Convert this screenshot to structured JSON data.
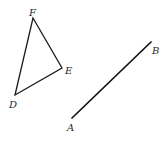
{
  "figure": {
    "background": "#ffffff",
    "stroke_color": "#1a1a1a",
    "triangle": {
      "vertices": [
        {
          "name": "F",
          "x": 33,
          "y": 18,
          "label_x": 29,
          "label_y": 16
        },
        {
          "name": "E",
          "x": 62,
          "y": 68,
          "label_x": 65,
          "label_y": 74
        },
        {
          "name": "D",
          "x": 15,
          "y": 95,
          "label_x": 9,
          "label_y": 108
        }
      ]
    },
    "segment": {
      "endpoints": [
        {
          "name": "A",
          "x": 72,
          "y": 118,
          "label_x": 67,
          "label_y": 131
        },
        {
          "name": "B",
          "x": 151,
          "y": 42,
          "label_x": 152,
          "label_y": 54
        }
      ]
    }
  }
}
